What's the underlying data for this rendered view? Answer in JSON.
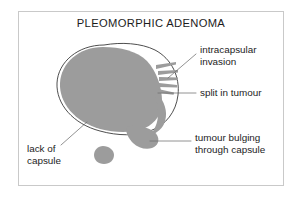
{
  "figure": {
    "title": "PLEOMORPHIC ADENOMA",
    "background_color": "#ffffff",
    "frame_color": "#c9c9c9",
    "tumour_color": "#9c9c9c",
    "capsule_color": "#3a3a3a",
    "leader_color": "#6e6e6e",
    "text_color": "#1c1c1c"
  },
  "labels": {
    "intracapsular_invasion": {
      "line1": "intracapsular",
      "line2": "invasion"
    },
    "split_in_tumour": {
      "line1": "split in tumour"
    },
    "tumour_bulging": {
      "line1": "tumour bulging",
      "line2": "through capsule"
    },
    "lack_of_capsule": {
      "line1": "lack of",
      "line2": "capsule"
    }
  },
  "anatomy": {
    "main_mass_name": "tumour-mass",
    "capsule_name": "capsule-outline",
    "invasion_fingers_name": "invasion-fingers",
    "split_sliver_name": "split-sliver",
    "bulge_name": "capsule-bulge",
    "satellite_name": "satellite-nodule"
  }
}
